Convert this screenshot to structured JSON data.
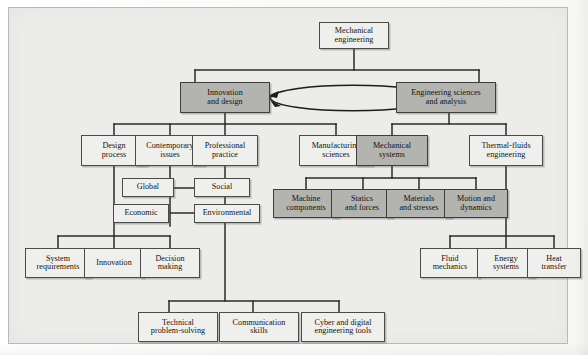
{
  "figure": {
    "type": "hierarchy-tree-diagram",
    "title_text": "",
    "background_color": "#ececeb",
    "shaded_node_color": "#b3b3b0",
    "plain_node_color": "#efefee",
    "border_color": "#4a4a48"
  },
  "nodes": {
    "root": {
      "line1": "Mechanical",
      "line2": "engineering",
      "shaded": false
    },
    "innovation_and_design": {
      "line1": "Innovation",
      "line2": "and design",
      "shaded": true
    },
    "engineering_sciences": {
      "line1": "Engineering sciences",
      "line2": "and analysis",
      "shaded": true
    },
    "design_process": {
      "line1": "Design",
      "line2": "process",
      "shaded": false
    },
    "contemporary_issues": {
      "line1": "Contemporary",
      "line2": "issues",
      "shaded": false
    },
    "professional_practice": {
      "line1": "Professional",
      "line2": "practice",
      "shaded": false
    },
    "manufacturing_sciences": {
      "line1": "Manufacturing",
      "line2": "sciences",
      "shaded": false
    },
    "mechanical_systems": {
      "line1": "Mechanical",
      "line2": "systems",
      "shaded": true
    },
    "thermal_fluids": {
      "line1": "Thermal-fluids",
      "line2": "engineering",
      "shaded": false
    },
    "global": {
      "line1": "Global",
      "line2": "",
      "shaded": false
    },
    "social": {
      "line1": "Social",
      "line2": "",
      "shaded": false
    },
    "economic": {
      "line1": "Economic",
      "line2": "",
      "shaded": false
    },
    "environmental": {
      "line1": "Environmental",
      "line2": "",
      "shaded": false
    },
    "machine_components": {
      "line1": "Machine",
      "line2": "components",
      "shaded": true
    },
    "statics_and_forces": {
      "line1": "Statics",
      "line2": "and forces",
      "shaded": true
    },
    "materials_and_stresses": {
      "line1": "Materials",
      "line2": "and stresses",
      "shaded": true
    },
    "motion_and_dynamics": {
      "line1": "Motion and",
      "line2": "dynamics",
      "shaded": true
    },
    "system_requirements": {
      "line1": "System",
      "line2": "requirements",
      "shaded": false
    },
    "innovation": {
      "line1": "Innovation",
      "line2": "",
      "shaded": false
    },
    "decision_making": {
      "line1": "Decision",
      "line2": "making",
      "shaded": false
    },
    "fluid_mechanics": {
      "line1": "Fluid",
      "line2": "mechanics",
      "shaded": false
    },
    "energy_systems": {
      "line1": "Energy",
      "line2": "systems",
      "shaded": false
    },
    "heat_transfer": {
      "line1": "Heat",
      "line2": "transfer",
      "shaded": false
    },
    "technical_problem_solving": {
      "line1": "Technical",
      "line2": "problem-solving",
      "shaded": false
    },
    "communication_skills": {
      "line1": "Communication",
      "line2": "skills",
      "shaded": false
    },
    "cyber_and_digital": {
      "line1": "Cyber and digital",
      "line2": "engineering tools",
      "shaded": false
    }
  },
  "edges": {
    "bidirectional_loop_label": "",
    "description": "Mechanical engineering branches to Innovation and design and Engineering sciences and analysis, which are joined by a two-headed elliptical arrow."
  }
}
